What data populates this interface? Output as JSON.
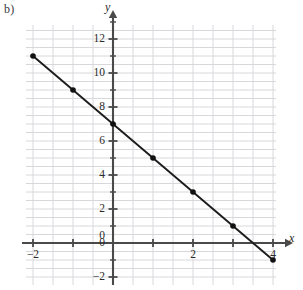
{
  "figure": {
    "part_label": "b)",
    "background_color": "#ffffff",
    "grid_color": "#d8d8dc",
    "axis_color": "#4a4a4a",
    "line_color": "#1c1c1c",
    "point_color": "#111111"
  },
  "axes": {
    "x_axis_label": "x",
    "y_axis_label": "y",
    "x_ticks": [
      {
        "value": -2,
        "label": "−2"
      },
      {
        "value": 0,
        "label": "0"
      },
      {
        "value": 2,
        "label": "2"
      },
      {
        "value": 4,
        "label": "4"
      }
    ],
    "y_ticks": [
      {
        "value": 12,
        "label": "12"
      },
      {
        "value": 10,
        "label": "10"
      },
      {
        "value": 8,
        "label": "8"
      },
      {
        "value": 6,
        "label": "6"
      },
      {
        "value": 4,
        "label": "4"
      },
      {
        "value": 2,
        "label": "2"
      },
      {
        "value": 0,
        "label": "0"
      },
      {
        "value": -2,
        "label": "−2"
      }
    ]
  },
  "chart_data": {
    "type": "line",
    "title": "",
    "subtitle": "",
    "xlabel": "x",
    "ylabel": "y",
    "xlim": [
      -2.2,
      4.1
    ],
    "ylim": [
      -2.1,
      13.0
    ],
    "grid": true,
    "grid_step": 0.5,
    "legend": null,
    "equation": "y = -2x + 7",
    "slope": -2,
    "y_intercept": 7,
    "x_tick_values": [
      -2,
      0,
      2,
      4
    ],
    "y_tick_values": [
      12,
      10,
      8,
      6,
      4,
      2,
      0,
      -2
    ],
    "series": [
      {
        "name": "y = -2x + 7",
        "x": [
          -2,
          -1,
          0,
          1,
          2,
          3,
          4
        ],
        "values": [
          11,
          9,
          7,
          5,
          3,
          1,
          -1
        ],
        "marker": "filled-circle",
        "line_style": "solid"
      }
    ],
    "points": [
      {
        "x": -2,
        "y": 11
      },
      {
        "x": -1,
        "y": 9
      },
      {
        "x": 0,
        "y": 7
      },
      {
        "x": 1,
        "y": 5
      },
      {
        "x": 2,
        "y": 3
      },
      {
        "x": 3,
        "y": 1
      },
      {
        "x": 4,
        "y": -1
      }
    ]
  }
}
